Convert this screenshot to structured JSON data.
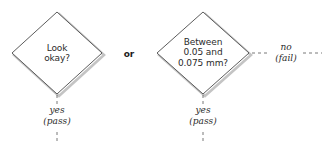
{
  "diagram": {
    "type": "flowchart-decision-fragment",
    "background_color": "#ffffff",
    "stroke_color": "#4a4a4a",
    "shadow_color": "#bdbdbd",
    "text_color": "#2b2b2b",
    "nodes": [
      {
        "id": "decision-look-okay",
        "shape": "diamond",
        "lines": [
          "Look",
          "okay?"
        ],
        "cx": 57,
        "cy": 53,
        "rx": 45,
        "ry": 41
      },
      {
        "id": "decision-between-tolerance",
        "shape": "diamond",
        "lines": [
          "Between",
          "0.05 and",
          "0.075 mm?"
        ],
        "cx": 203,
        "cy": 53,
        "rx": 46,
        "ry": 41
      }
    ],
    "conjunction": {
      "label": "or",
      "x": 129,
      "y": 49
    },
    "edge_labels": [
      {
        "id": "yes-pass-left",
        "lines": [
          "yes",
          "(pass)"
        ],
        "cx": 57,
        "cy": 113,
        "orientation": "vertical"
      },
      {
        "id": "yes-pass-right",
        "lines": [
          "yes",
          "(pass)"
        ],
        "cx": 203,
        "cy": 113,
        "orientation": "vertical"
      },
      {
        "id": "no-fail-right",
        "lines": [
          "no",
          "(fail)"
        ],
        "cx": 286,
        "cy": 47,
        "orientation": "horizontal"
      }
    ]
  }
}
